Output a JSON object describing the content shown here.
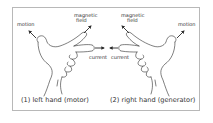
{
  "diagram": {
    "left_panel": {
      "labels": {
        "motion": "motion",
        "magnetic_field_line1": "magnetic",
        "magnetic_field_line2": "field",
        "current": "current"
      },
      "caption": "(1) left hand (motor)"
    },
    "right_panel": {
      "labels": {
        "motion": "motion",
        "magnetic_field_line1": "magnetic",
        "magnetic_field_line2": "field",
        "current": "current"
      },
      "caption": "(2) right hand (generator)"
    },
    "colors": {
      "stroke": "#2a2a2a",
      "frame": "#b8b8b8",
      "background": "#ffffff"
    }
  }
}
